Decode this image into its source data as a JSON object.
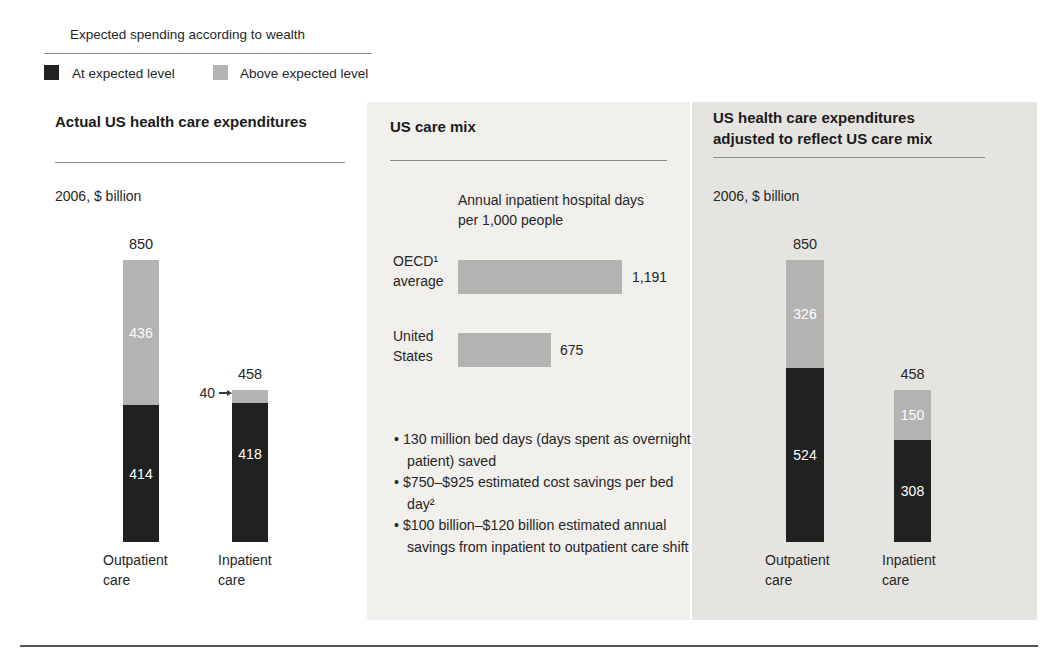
{
  "legend": {
    "title": "Expected spending according to wealth",
    "items": [
      {
        "label": "At expected level"
      },
      {
        "label": "Above expected level"
      }
    ]
  },
  "colors": {
    "at_expected": "#212121",
    "above_expected": "#b4b3b1",
    "panel_mid_bg": "#f1f0ed",
    "panel_right_bg": "#e6e4e1"
  },
  "panel_left": {
    "title": "Actual US health care expenditures",
    "unit": "2006, $ billion",
    "bars": [
      {
        "category_line1": "Outpatient",
        "category_line2": "care",
        "total": "850",
        "above": "436",
        "at": "414"
      },
      {
        "category_line1": "Inpatient",
        "category_line2": "care",
        "total": "458",
        "above": "40",
        "at": "418"
      }
    ]
  },
  "panel_mid": {
    "title": "US care mix",
    "chart_header_line1": "Annual inpatient hospital days",
    "chart_header_line2": "per 1,000 people",
    "rows": [
      {
        "label_line1": "OECD¹",
        "label_line2": "average",
        "value": "1,191"
      },
      {
        "label_line1": "United",
        "label_line2": "States",
        "value": "675"
      }
    ],
    "bullets": [
      "130 million bed days (days spent as overnight patient) saved",
      "$750–$925 estimated cost savings per bed day²",
      "$100 billion–$120 billion estimated annual savings from inpatient to outpatient care shift"
    ]
  },
  "panel_right": {
    "title_line1": "US health care expenditures",
    "title_line2": "adjusted to reflect US care mix",
    "unit": "2006, $ billion",
    "bars": [
      {
        "category_line1": "Outpatient",
        "category_line2": "care",
        "total": "850",
        "above": "326",
        "at": "524"
      },
      {
        "category_line1": "Inpatient",
        "category_line2": "care",
        "total": "458",
        "above": "150",
        "at": "308"
      }
    ]
  },
  "chart_data": [
    {
      "type": "bar",
      "stacked": true,
      "title": "Actual US health care expenditures",
      "unit": "2006, $ billion",
      "categories": [
        "Outpatient care",
        "Inpatient care"
      ],
      "series": [
        {
          "name": "At expected level",
          "values": [
            414,
            418
          ]
        },
        {
          "name": "Above expected level",
          "values": [
            436,
            40
          ]
        }
      ],
      "totals": [
        850,
        458
      ]
    },
    {
      "type": "bar",
      "orientation": "horizontal",
      "title": "US care mix",
      "xlabel": "Annual inpatient hospital days per 1,000 people",
      "categories": [
        "OECD¹ average",
        "United States"
      ],
      "values": [
        1191,
        675
      ],
      "value_labels": [
        "1,191",
        "675"
      ]
    },
    {
      "type": "bar",
      "stacked": true,
      "title": "US health care expenditures adjusted to reflect US care mix",
      "unit": "2006, $ billion",
      "categories": [
        "Outpatient care",
        "Inpatient care"
      ],
      "series": [
        {
          "name": "At expected level",
          "values": [
            524,
            308
          ]
        },
        {
          "name": "Above expected level",
          "values": [
            326,
            150
          ]
        }
      ],
      "totals": [
        850,
        458
      ]
    }
  ]
}
